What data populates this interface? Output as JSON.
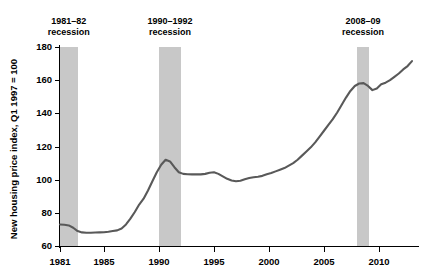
{
  "chart_data": {
    "type": "line",
    "title": "",
    "xlabel": "",
    "ylabel": "New housing price index, Q1 1997 = 100",
    "xlim": [
      1981,
      2013
    ],
    "ylim": [
      60,
      180
    ],
    "grid": false,
    "legend": "none",
    "xticks": [
      1981,
      1985,
      1990,
      1995,
      2000,
      2005,
      2010
    ],
    "xtick_labels": [
      "1981",
      "1985",
      "1990",
      "1995",
      "2000",
      "2005",
      "2010"
    ],
    "yticks": [
      60,
      80,
      100,
      120,
      140,
      160,
      180
    ],
    "ytick_labels": [
      "60",
      "80",
      "100",
      "120",
      "140",
      "160",
      "180"
    ],
    "line_color": "#595959",
    "band_color": "#c8c8c8",
    "annotations": [
      {
        "label_line1": "1981–82",
        "label_line2": "recession",
        "start": 1981.0,
        "end": 1982.6
      },
      {
        "label_line1": "1990–1992",
        "label_line2": "recession",
        "start": 1990.0,
        "end": 1992.0
      },
      {
        "label_line1": "2008–09",
        "label_line2": "recession",
        "start": 2008.0,
        "end": 2009.1
      }
    ],
    "series": [
      {
        "name": "New housing price index",
        "x": [
          1981.0,
          1981.4,
          1981.8,
          1982.2,
          1982.6,
          1983.0,
          1983.4,
          1983.8,
          1984.2,
          1984.6,
          1985.0,
          1985.4,
          1985.8,
          1986.2,
          1986.6,
          1987.0,
          1987.4,
          1987.8,
          1988.2,
          1988.6,
          1989.0,
          1989.4,
          1989.8,
          1990.2,
          1990.6,
          1991.0,
          1991.4,
          1991.8,
          1992.2,
          1992.6,
          1993.0,
          1993.4,
          1993.8,
          1994.2,
          1994.6,
          1995.0,
          1995.4,
          1995.8,
          1996.2,
          1996.6,
          1997.0,
          1997.4,
          1997.8,
          1998.2,
          1998.6,
          1999.0,
          1999.4,
          1999.8,
          2000.2,
          2000.6,
          2001.0,
          2001.4,
          2001.8,
          2002.2,
          2002.6,
          2003.0,
          2003.4,
          2003.8,
          2004.2,
          2004.6,
          2005.0,
          2005.4,
          2005.8,
          2006.2,
          2006.6,
          2007.0,
          2007.4,
          2007.8,
          2008.2,
          2008.6,
          2009.0,
          2009.4,
          2009.8,
          2010.2,
          2010.6,
          2011.0,
          2011.4,
          2011.8,
          2012.2,
          2012.6,
          2013.0
        ],
        "y": [
          73.0,
          72.8,
          72.4,
          71.0,
          69.0,
          68.2,
          68.0,
          68.0,
          68.1,
          68.2,
          68.3,
          68.6,
          69.0,
          69.4,
          70.6,
          73.0,
          76.5,
          80.5,
          85.0,
          88.5,
          93.5,
          99.0,
          104.5,
          109.0,
          112.0,
          111.0,
          107.5,
          104.5,
          103.5,
          103.3,
          103.2,
          103.3,
          103.2,
          103.5,
          104.2,
          104.5,
          103.5,
          102.0,
          100.5,
          99.5,
          99.0,
          99.3,
          100.2,
          101.0,
          101.5,
          101.8,
          102.3,
          103.2,
          104.0,
          105.0,
          106.0,
          107.0,
          108.5,
          110.0,
          112.0,
          114.5,
          117.0,
          119.5,
          122.5,
          126.0,
          129.5,
          133.0,
          136.5,
          140.5,
          145.0,
          149.5,
          153.5,
          156.5,
          158.0,
          158.2,
          156.5,
          154.0,
          155.0,
          157.5,
          158.5,
          160.0,
          162.0,
          164.0,
          166.5,
          168.5,
          171.5
        ]
      }
    ]
  }
}
